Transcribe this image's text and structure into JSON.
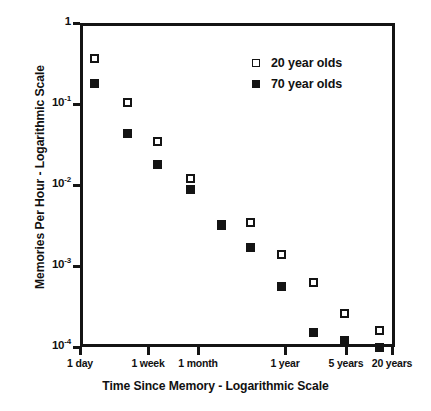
{
  "chart_data": {
    "type": "scatter",
    "title": "",
    "xlabel": "Time Since Memory - Logarithmic Scale",
    "ylabel": "Memories Per Hour - Logarithmic Scale",
    "xscale": "log",
    "yscale": "log",
    "grid": false,
    "legend_position": "top-right",
    "ylim": [
      0.0001,
      1
    ],
    "yticks": [
      {
        "value": 1,
        "label": "1",
        "mantissa": "1",
        "exponent": ""
      },
      {
        "value": 0.1,
        "label": "10-1",
        "mantissa": "10",
        "exponent": "-1"
      },
      {
        "value": 0.01,
        "label": "10-2",
        "mantissa": "10",
        "exponent": "-2"
      },
      {
        "value": 0.001,
        "label": "10-3",
        "mantissa": "10",
        "exponent": "-3"
      },
      {
        "value": 0.0001,
        "label": "10-4",
        "mantissa": "10",
        "exponent": "-4"
      }
    ],
    "xticks": [
      {
        "label": "1 day",
        "px": 80
      },
      {
        "label": "1 week",
        "px": 148
      },
      {
        "label": "1 month",
        "px": 198
      },
      {
        "label": "1 year",
        "px": 285
      },
      {
        "label": "5 years",
        "px": 346
      },
      {
        "label": "20 years",
        "px": 392
      }
    ],
    "series": [
      {
        "name": "20 year olds",
        "marker": "open-square",
        "points": [
          {
            "x_label": "1 day",
            "x_px": 94,
            "y": 0.36
          },
          {
            "x_label": "~3 days",
            "x_px": 127,
            "y": 0.105
          },
          {
            "x_label": "1 week",
            "x_px": 157,
            "y": 0.034
          },
          {
            "x_label": "~1 month",
            "x_px": 190,
            "y": 0.012
          },
          {
            "x_label": "~3 months",
            "x_px": 221,
            "y": 0.0033
          },
          {
            "x_label": "~6 months",
            "x_px": 250,
            "y": 0.0034
          },
          {
            "x_label": "1 year",
            "x_px": 281,
            "y": 0.0014
          },
          {
            "x_label": "~2 years",
            "x_px": 313,
            "y": 0.00063
          },
          {
            "x_label": "5 years",
            "x_px": 344,
            "y": 0.00026
          },
          {
            "x_label": "20 years",
            "x_px": 379,
            "y": 0.00016
          }
        ]
      },
      {
        "name": "70 year olds",
        "marker": "filled-square",
        "points": [
          {
            "x_label": "1 day",
            "x_px": 94,
            "y": 0.18
          },
          {
            "x_label": "~3 days",
            "x_px": 127,
            "y": 0.043
          },
          {
            "x_label": "1 week",
            "x_px": 157,
            "y": 0.018
          },
          {
            "x_label": "~1 month",
            "x_px": 190,
            "y": 0.0088
          },
          {
            "x_label": "~3 months",
            "x_px": 221,
            "y": 0.0032
          },
          {
            "x_label": "~6 months",
            "x_px": 250,
            "y": 0.0017
          },
          {
            "x_label": "1 year",
            "x_px": 281,
            "y": 0.00056
          },
          {
            "x_label": "~2 years",
            "x_px": 313,
            "y": 0.00015
          },
          {
            "x_label": "5 years",
            "x_px": 344,
            "y": 0.000122
          },
          {
            "x_label": "20 years",
            "x_px": 379,
            "y": 0.0001
          }
        ]
      }
    ],
    "legend": [
      {
        "label": "20 year olds",
        "marker": "open-square"
      },
      {
        "label": "70 year olds",
        "marker": "filled-square"
      }
    ]
  }
}
